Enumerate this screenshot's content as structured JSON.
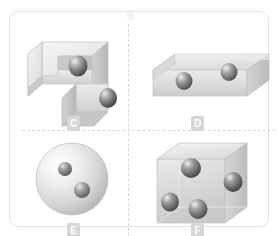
{
  "panel": {
    "name": "geometry-figure-panel",
    "border_color": "#e2e2e2",
    "divider_color": "#d8d8d8",
    "background": "#ffffff"
  },
  "labels": {
    "c": "C",
    "d": "D",
    "e": "E",
    "f": "F",
    "badge_bg": "#d6d6d6",
    "badge_fg": "#ffffff"
  },
  "figures": [
    {
      "id": "c",
      "label": "C",
      "shape": "l-shaped-block",
      "shape_name": "L-shaped prism",
      "sphere_count": 2,
      "quadrant": "top-left"
    },
    {
      "id": "d",
      "label": "D",
      "shape": "flat-rectangular-box",
      "shape_name": "Flat rectangular box",
      "sphere_count": 2,
      "quadrant": "top-right"
    },
    {
      "id": "e",
      "label": "E",
      "shape": "sphere",
      "shape_name": "Large sphere",
      "sphere_count": 2,
      "quadrant": "bottom-left"
    },
    {
      "id": "f",
      "label": "F",
      "shape": "cube",
      "shape_name": "Cube",
      "sphere_count": 4,
      "quadrant": "bottom-right"
    }
  ],
  "palette": {
    "solid_light": "#f0f0f0",
    "solid_mid": "#d9d9d9",
    "solid_dark": "#bdbdbd",
    "solid_edge": "#c8c8c8",
    "sphere_light": "#efefef",
    "sphere_mid": "#9a9a9a",
    "sphere_dark": "#5a5a5a"
  }
}
